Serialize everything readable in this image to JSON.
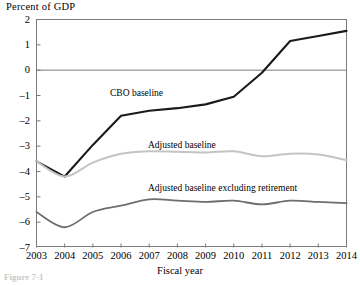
{
  "chart_data": {
    "type": "line",
    "title": "Percent of GDP",
    "xlabel": "Fiscal year",
    "ylabel": "Percent of GDP",
    "x": [
      2003,
      2004,
      2005,
      2006,
      2007,
      2008,
      2009,
      2010,
      2011,
      2012,
      2013,
      2014
    ],
    "xlim": [
      2003,
      2014
    ],
    "ylim": [
      -7,
      2
    ],
    "yticks": [
      2,
      1,
      0,
      -1,
      -2,
      -3,
      -4,
      -5,
      -6,
      -7
    ],
    "xticks": [
      "2003",
      "2004",
      "2005",
      "2006",
      "2007",
      "2008",
      "2009",
      "2010",
      "2011",
      "2012",
      "2013",
      "2014"
    ],
    "ytick_labels": [
      "2",
      "1",
      "0",
      "-1",
      "-2",
      "-3",
      "-4",
      "-5",
      "-6",
      "-7"
    ],
    "grid": false,
    "zero_line": true,
    "legend_position": "inline-annotations",
    "series": [
      {
        "name": "CBO baseline",
        "color": "#1a1a1a",
        "width": 2.1,
        "values": [
          -3.6,
          -4.2,
          -2.95,
          -1.8,
          -1.6,
          -1.5,
          -1.35,
          -1.05,
          -0.1,
          1.15,
          1.35,
          1.55
        ]
      },
      {
        "name": "Adjusted baseline",
        "color": "#c4c4c4",
        "width": 2.0,
        "values": [
          -3.6,
          -4.2,
          -3.65,
          -3.3,
          -3.2,
          -3.22,
          -3.25,
          -3.2,
          -3.4,
          -3.3,
          -3.33,
          -3.55
        ]
      },
      {
        "name": "Adjusted baseline excluding retirement",
        "color": "#6e6e6e",
        "width": 1.8,
        "values": [
          -5.6,
          -6.2,
          -5.6,
          -5.35,
          -5.1,
          -5.15,
          -5.2,
          -5.15,
          -5.3,
          -5.15,
          -5.2,
          -5.25
        ]
      }
    ],
    "annotations": [
      {
        "text": "CBO baseline",
        "x": 2006.2,
        "y": -1.05
      },
      {
        "text": "Adjusted baseline",
        "x": 2007.6,
        "y": -3.0
      },
      {
        "text": "Adjusted baseline excluding retirement",
        "x": 2007.6,
        "y": -4.75
      }
    ]
  },
  "figure": {
    "caption_partial": "Figure 7-1"
  }
}
